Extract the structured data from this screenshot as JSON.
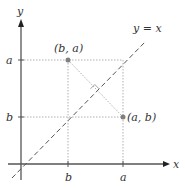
{
  "diagram": {
    "axes": {
      "x_label": "x",
      "y_label": "y"
    },
    "ticks": {
      "x": [
        "b",
        "a"
      ],
      "y": [
        "a",
        "b"
      ]
    },
    "line": {
      "label": "y = x",
      "style": "dashed"
    },
    "points": [
      {
        "label": "(b, a)",
        "x": "b",
        "y": "a"
      },
      {
        "label": "(a, b)",
        "x": "a",
        "y": "b"
      }
    ],
    "annotations": {
      "right_angle_marker": true,
      "connector": "dotted segment between (b, a) and (a, b), perpendicular to y = x"
    },
    "colors": {
      "axis": "#555555",
      "point": "#808080",
      "dotted_guides": "#b0b0b0",
      "dashed_line": "#555555",
      "text": "#333333"
    }
  }
}
